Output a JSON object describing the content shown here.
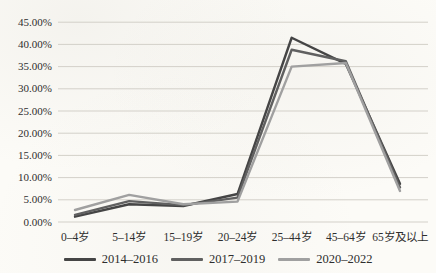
{
  "page": {
    "background": "#fcfbf7"
  },
  "chart_data": {
    "type": "line",
    "title": "",
    "categories": [
      "0–4岁",
      "5–14岁",
      "15–19岁",
      "20–24岁",
      "25–44岁",
      "45–64岁",
      "65岁及以上"
    ],
    "series": [
      {
        "name": "2014–2016",
        "color": "#454545",
        "values": [
          1.2,
          4.0,
          3.6,
          6.3,
          41.5,
          35.6,
          8.6
        ]
      },
      {
        "name": "2017–2019",
        "color": "#606060",
        "values": [
          1.6,
          4.7,
          3.8,
          5.5,
          38.8,
          36.2,
          7.8
        ]
      },
      {
        "name": "2020–2022",
        "color": "#a0a0a0",
        "values": [
          2.7,
          6.1,
          4.0,
          4.6,
          35.0,
          35.8,
          7.0
        ]
      }
    ],
    "ylim": [
      0,
      45
    ],
    "ytick_step": 5,
    "ytick_labels": [
      "0.00%",
      "5.00%",
      "10.00%",
      "15.00%",
      "20.00%",
      "25.00%",
      "30.00%",
      "35.00%",
      "40.00%",
      "45.00%"
    ],
    "grid": "horizontal-only",
    "gridline_color": "#d3d0c9",
    "legend_position": "bottom",
    "text_color": "#2e2e2e"
  }
}
